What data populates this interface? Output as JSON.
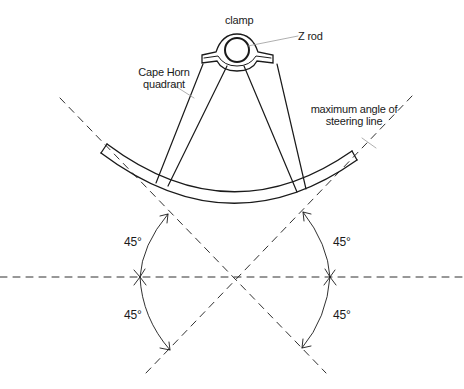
{
  "diagram": {
    "labels": {
      "clamp": "clamp",
      "z_rod": "Z rod",
      "quadrant_line1": "Cape Horn",
      "quadrant_line2": "quadrant",
      "max_angle_line1": "maximum angle of",
      "max_angle_line2": "steering line"
    },
    "angles": {
      "left_upper": "45°",
      "left_lower": "45°",
      "right_upper": "45°",
      "right_lower": "45°"
    },
    "colors": {
      "ink": "#1a1a1a",
      "leader": "#9a9a9a",
      "background": "#ffffff"
    }
  }
}
